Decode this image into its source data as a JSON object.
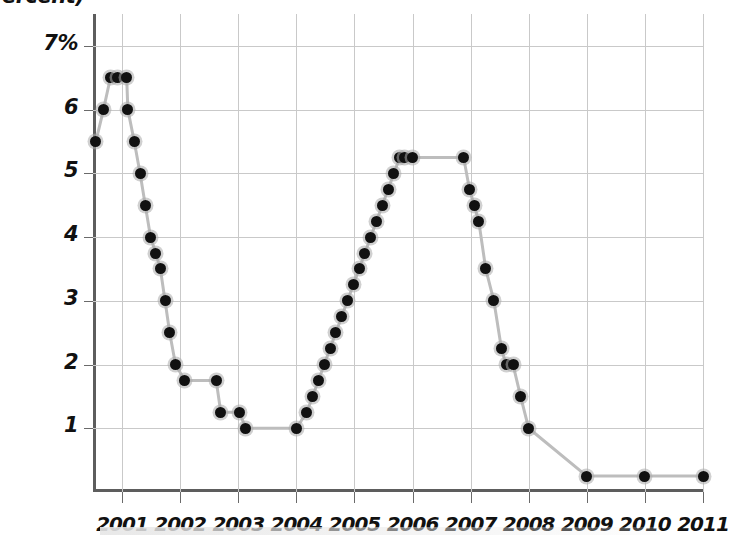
{
  "header": {
    "axis_unit_label": "(Percent)",
    "clipped_top_text": "ercent)"
  },
  "chart_data": {
    "type": "line",
    "title": "",
    "xlabel": "",
    "ylabel": "(Percent)",
    "ylim": [
      0,
      7.5
    ],
    "xlim": [
      2000.5,
      2011.0
    ],
    "grid": true,
    "legend": "none",
    "y_ticks": [
      1,
      2,
      3,
      4,
      5,
      6,
      7
    ],
    "y_tick_labels": [
      "1",
      "2",
      "3",
      "4",
      "5",
      "6",
      "7%"
    ],
    "x_ticks": [
      2001,
      2002,
      2003,
      2004,
      2005,
      2006,
      2007,
      2008,
      2009,
      2010,
      2011
    ],
    "x_tick_labels": [
      "2001",
      "2002",
      "2003",
      "2004",
      "2005",
      "2006",
      "2007",
      "2008",
      "2009",
      "2010",
      "2011"
    ],
    "marker": "circle",
    "marker_color": "#111111",
    "line_color": "#bdbdbd",
    "series": [
      {
        "name": "Federal funds target rate",
        "x": [
          2000.55,
          2000.68,
          2000.8,
          2000.93,
          2001.08,
          2001.1,
          2001.21,
          2001.31,
          2001.4,
          2001.49,
          2001.58,
          2001.66,
          2001.74,
          2001.82,
          2001.92,
          2002.08,
          2002.62,
          2002.7,
          2003.02,
          2003.13,
          2004.0,
          2004.18,
          2004.28,
          2004.38,
          2004.48,
          2004.58,
          2004.68,
          2004.78,
          2004.88,
          2004.98,
          2005.08,
          2005.18,
          2005.28,
          2005.38,
          2005.48,
          2005.58,
          2005.68,
          2005.78,
          2005.86,
          2006.0,
          2006.88,
          2006.98,
          2007.06,
          2007.14,
          2007.26,
          2007.4,
          2007.53,
          2007.61,
          2007.73,
          2007.86,
          2008.0,
          2009.0,
          2010.0,
          2011.0
        ],
        "y": [
          5.5,
          6.0,
          6.5,
          6.5,
          6.5,
          6.0,
          5.5,
          5.0,
          4.5,
          4.0,
          3.75,
          3.5,
          3.0,
          2.5,
          2.0,
          1.75,
          1.75,
          1.25,
          1.25,
          1.0,
          1.0,
          1.25,
          1.5,
          1.75,
          2.0,
          2.25,
          2.5,
          2.75,
          3.0,
          3.25,
          3.5,
          3.75,
          4.0,
          4.25,
          4.5,
          4.75,
          5.0,
          5.25,
          5.25,
          5.25,
          5.25,
          4.75,
          4.5,
          4.25,
          3.5,
          3.0,
          2.25,
          2.0,
          2.0,
          1.5,
          1.0,
          0.25,
          0.25,
          0.25
        ]
      }
    ]
  }
}
